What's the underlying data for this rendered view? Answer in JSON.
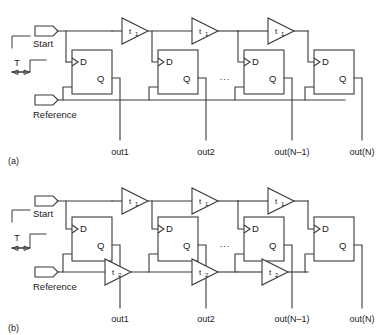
{
  "figure": {
    "type": "circuit-schematic",
    "panels": [
      {
        "id": "a",
        "label": "(a)",
        "inputs": [
          {
            "name": "start-input",
            "label": "Start"
          },
          {
            "name": "reference-input",
            "label": "Reference"
          }
        ],
        "timing": {
          "interval_label": "T"
        },
        "buffers": [
          {
            "label": "t",
            "subscript": "1"
          },
          {
            "label": "t",
            "subscript": "1"
          },
          {
            "label": "t",
            "subscript": "1"
          }
        ],
        "flipflops": [
          {
            "d": "D",
            "q": "Q"
          },
          {
            "d": "D",
            "q": "Q"
          },
          {
            "d": "D",
            "q": "Q"
          },
          {
            "d": "D",
            "q": "Q"
          }
        ],
        "ellipsis": "...",
        "outputs": [
          "out1",
          "out2",
          "out(N–1)",
          "out(N)"
        ]
      },
      {
        "id": "b",
        "label": "(b)",
        "inputs": [
          {
            "name": "start-input",
            "label": "Start"
          },
          {
            "name": "reference-input",
            "label": "Reference"
          }
        ],
        "timing": {
          "interval_label": "T"
        },
        "buffers_top": [
          {
            "label": "t",
            "subscript": "1"
          },
          {
            "label": "t",
            "subscript": "1"
          },
          {
            "label": "t",
            "subscript": "1"
          }
        ],
        "buffers_bottom": [
          {
            "label": "t",
            "subscript": "2"
          },
          {
            "label": "t",
            "subscript": "2"
          },
          {
            "label": "t",
            "subscript": "2"
          }
        ],
        "flipflops": [
          {
            "d": "D",
            "q": "Q"
          },
          {
            "d": "D",
            "q": "Q"
          },
          {
            "d": "D",
            "q": "Q"
          },
          {
            "d": "D",
            "q": "Q"
          }
        ],
        "ellipsis": "...",
        "outputs": [
          "out1",
          "out2",
          "out(N–1)",
          "out(N)"
        ]
      }
    ],
    "colors": {
      "background": "#ffffff",
      "line": "#3a3a3a",
      "text": "#1a1a1a"
    }
  }
}
